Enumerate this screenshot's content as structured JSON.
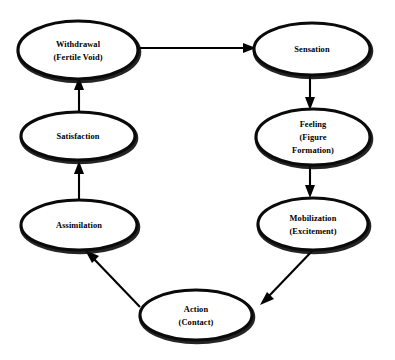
{
  "diagram": {
    "type": "cycle-flow-diagram",
    "background_color": "#ffffff",
    "line_color": "#000000",
    "node_fill": "#ffffff",
    "nodes": [
      {
        "id": "withdrawal",
        "lines": [
          "Withdrawal",
          "(Fertile Void)"
        ],
        "cx": 78,
        "cy": 50,
        "rx": 60,
        "ry": 29
      },
      {
        "id": "sensation",
        "lines": [
          "Sensation"
        ],
        "cx": 312,
        "cy": 49,
        "rx": 58,
        "ry": 26
      },
      {
        "id": "feeling",
        "lines": [
          "Feeling",
          "(Figure",
          "Formation)"
        ],
        "cx": 313,
        "cy": 137,
        "rx": 57,
        "ry": 28
      },
      {
        "id": "satisfaction",
        "lines": [
          "Satisfaction"
        ],
        "cx": 78,
        "cy": 136,
        "rx": 57,
        "ry": 24
      },
      {
        "id": "assimilation",
        "lines": [
          "Assimilation"
        ],
        "cx": 79,
        "cy": 225,
        "rx": 58,
        "ry": 25
      },
      {
        "id": "mobilization",
        "lines": [
          "Mobilization",
          "(Excitement)"
        ],
        "cx": 313,
        "cy": 224,
        "rx": 55,
        "ry": 26
      },
      {
        "id": "action",
        "lines": [
          "Action",
          "(Contact)"
        ],
        "cx": 196,
        "cy": 315,
        "rx": 56,
        "ry": 25
      }
    ],
    "edges": [
      {
        "id": "withdrawal-to-sensation",
        "from": "withdrawal",
        "to": "sensation",
        "direction": "right"
      },
      {
        "id": "sensation-to-feeling",
        "from": "sensation",
        "to": "feeling",
        "direction": "down"
      },
      {
        "id": "feeling-to-mobilization",
        "from": "feeling",
        "to": "mobilization",
        "direction": "down"
      },
      {
        "id": "mobilization-to-action",
        "from": "mobilization",
        "to": "action",
        "direction": "down-left"
      },
      {
        "id": "action-to-assimilation",
        "from": "action",
        "to": "assimilation",
        "direction": "up-left"
      },
      {
        "id": "assimilation-to-satisfaction",
        "from": "assimilation",
        "to": "satisfaction",
        "direction": "up"
      },
      {
        "id": "satisfaction-to-withdrawal",
        "from": "satisfaction",
        "to": "withdrawal",
        "direction": "up"
      }
    ]
  }
}
